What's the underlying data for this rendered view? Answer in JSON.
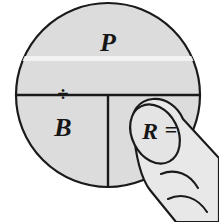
{
  "figure": {
    "background_color": "#ffffff"
  },
  "circle": {
    "fill_color": "#dcdcdc",
    "stroke_color": "#1a1a1a",
    "center_x": 108,
    "center_y": 95,
    "radius": 92,
    "highlight_band_color": "#f2f2f2"
  },
  "dividers": {
    "horizontal_label": "horizontal-divider",
    "vertical_label": "vertical-divider",
    "stroke_color": "#1a1a1a"
  },
  "sections": {
    "top": {
      "name": "percentage",
      "label": "P",
      "x": 108,
      "y": 51
    },
    "bottom_left": {
      "name": "base",
      "label": "B",
      "x": 63,
      "y": 136
    },
    "bottom_right": {
      "name": "rate",
      "label": "R",
      "x": 150,
      "y": 139
    }
  },
  "operators": {
    "divide": {
      "name": "divide-symbol",
      "label": "÷",
      "x": 63,
      "y": 96
    },
    "equals": {
      "name": "equals-symbol",
      "label": "=",
      "x": 171,
      "y": 139
    }
  },
  "hand": {
    "name": "pointing-hand",
    "fill_color": "#e8e8e8",
    "stroke_color": "#1a1a1a",
    "fingernail_fill": "#e4e4e4",
    "crease_count": 2
  },
  "formula": {
    "expression": "P ÷ B = R",
    "reads": "Percentage divided by Base equals Rate"
  }
}
